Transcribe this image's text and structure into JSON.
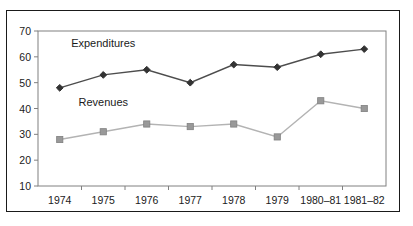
{
  "chart_data": {
    "type": "line",
    "title": "",
    "subtitle": "",
    "xlabel": "",
    "ylabel": "",
    "categories": [
      "1974",
      "1975",
      "1976",
      "1977",
      "1978",
      "1979",
      "1980–81",
      "1981–82"
    ],
    "ylim": [
      10,
      70
    ],
    "yticks": [
      10,
      20,
      30,
      40,
      50,
      60,
      70
    ],
    "ytick_labels": [
      "10",
      "20",
      "30",
      "40",
      "50",
      "60",
      "70"
    ],
    "grid": false,
    "legend_position": "inline-annotation",
    "series": [
      {
        "name": "Expenditures",
        "values": [
          48,
          53,
          55,
          50,
          57,
          56,
          61,
          63
        ],
        "color": "#4d4d4d",
        "marker": "diamond",
        "marker_color": "#333333"
      },
      {
        "name": "Revenues",
        "values": [
          28,
          31,
          34,
          33,
          34,
          29,
          43,
          40
        ],
        "color": "#b3b3b3",
        "marker": "square",
        "marker_color": "#999999"
      }
    ],
    "annotations": [
      {
        "text": "Expenditures",
        "x_category": "1975",
        "y_value": 64
      },
      {
        "text": "Revenues",
        "x_category": "1975",
        "y_value": 41
      }
    ]
  },
  "frame": {
    "outer_border_color": "#1a1a1a",
    "axis_color": "#808080",
    "background_color": "#ffffff"
  }
}
